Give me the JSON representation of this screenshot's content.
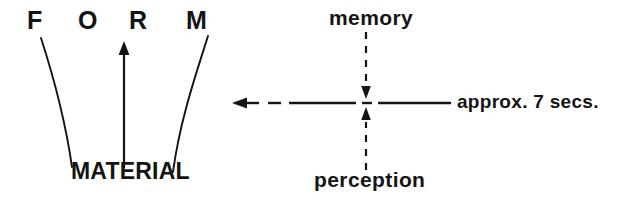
{
  "figure": {
    "ink_color": "#141414",
    "background_color": "#ffffff",
    "width": 625,
    "height": 202
  },
  "left_panel": {
    "heading_letters": [
      "F",
      "O",
      "R",
      "M"
    ],
    "heading_text": "FORM",
    "base_label": "MATERIAL",
    "connectors": {
      "left_curve": "curve from F down to MATERIAL",
      "center_arrow": "straight arrow from MATERIAL up to R",
      "right_curve": "curve from M down to MATERIAL"
    }
  },
  "right_panel": {
    "top_label": "memory",
    "bottom_label": "perception",
    "duration_label": "approx. 7 secs.",
    "axes": {
      "vertical": "dashed, arrows pointing inward to the centre",
      "horizontal": "solid with dash-gap break, arrow pointing left"
    }
  }
}
